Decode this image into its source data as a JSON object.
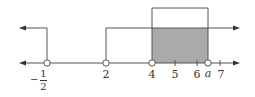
{
  "diagram": {
    "type": "number-line",
    "labels": {
      "neg_half_sign": "−",
      "neg_half_num": "1",
      "neg_half_den": "2",
      "two": "2",
      "four": "4",
      "five": "5",
      "six": "6",
      "a": "a",
      "seven": "7"
    },
    "colors": {
      "line": "#555555",
      "shade": "#aaaaaa"
    },
    "sets": [
      {
        "name": "x < -1/2 (open)",
        "direction": "left"
      },
      {
        "name": "x > 2 (open)",
        "direction": "right"
      },
      {
        "name": "4 < x < a",
        "box": true
      }
    ],
    "shaded_interval": [
      4,
      "a"
    ]
  }
}
